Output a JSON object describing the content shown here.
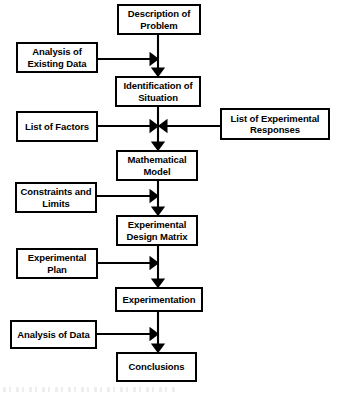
{
  "diagram": {
    "background_color": "#ffffff",
    "line_color": "#000000",
    "text_color": "#000000",
    "main_flow": [
      {
        "id": "description-of-problem",
        "label": "Description of Problem",
        "x": 117,
        "y": 4,
        "w": 84,
        "h": 31
      },
      {
        "id": "identification-of-situation",
        "label": "Identification of Situation",
        "x": 115,
        "y": 76,
        "w": 86,
        "h": 31
      },
      {
        "id": "mathematical-model",
        "label": "Mathematical Model",
        "x": 116,
        "y": 150,
        "w": 82,
        "h": 31
      },
      {
        "id": "experimental-design-matrix",
        "label": "Experimental Design Matrix",
        "x": 116,
        "y": 215,
        "w": 82,
        "h": 31
      },
      {
        "id": "experimentation",
        "label": "Experimentation",
        "x": 115,
        "y": 287,
        "w": 88,
        "h": 25
      },
      {
        "id": "conclusions",
        "label": "Conclusions",
        "x": 116,
        "y": 352,
        "w": 81,
        "h": 30
      }
    ],
    "left_inputs": [
      {
        "id": "analysis-of-existing-data",
        "label": "Analysis of Existing Data",
        "x": 16,
        "y": 42,
        "w": 82,
        "h": 31,
        "arrow_y": 59
      },
      {
        "id": "list-of-factors",
        "label": "List of Factors",
        "x": 16,
        "y": 111,
        "w": 82,
        "h": 31,
        "arrow_y": 126
      },
      {
        "id": "constraints-and-limits",
        "label": "Constraints and Limits",
        "x": 15,
        "y": 182,
        "w": 82,
        "h": 31,
        "arrow_y": 196
      },
      {
        "id": "experimental-plan",
        "label": "Experimental Plan",
        "x": 16,
        "y": 248,
        "w": 82,
        "h": 31,
        "arrow_y": 263
      },
      {
        "id": "analysis-of-data",
        "label": "Analysis of Data",
        "x": 10,
        "y": 320,
        "w": 87,
        "h": 29,
        "arrow_y": 334
      }
    ],
    "right_inputs": [
      {
        "id": "list-of-experimental-responses",
        "label": "List of Experimental Responses",
        "x": 220,
        "y": 108,
        "w": 110,
        "h": 32,
        "arrow_y": 126
      }
    ],
    "spine_x": 158
  }
}
